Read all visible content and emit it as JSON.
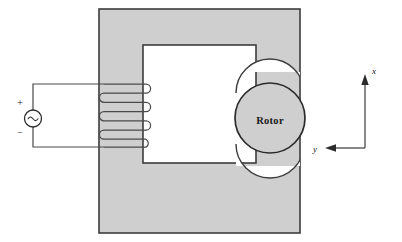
{
  "figure": {
    "type": "electromechanical-schematic"
  },
  "source": {
    "symbol": "~",
    "plus_label": "+",
    "minus_label": "−",
    "name": "ac-voltage-source"
  },
  "coil": {
    "turns": 5,
    "name": "stator-winding"
  },
  "core": {
    "label": "",
    "fill_color": "#cfcfcf",
    "stroke_color": "#3c3c3c",
    "window_fill": "#ffffff"
  },
  "rotor": {
    "label": "Rotor",
    "fill_color": "#cfcfcf",
    "stroke_color": "#2b2b2b"
  },
  "axes": {
    "x_label": "x",
    "y_label": "y",
    "x_direction": "up",
    "y_direction": "left"
  },
  "colors": {
    "wire": "#4a4a4a",
    "background": "#ffffff",
    "core_gray": "#cfcfcf",
    "outline": "#3c3c3c"
  }
}
